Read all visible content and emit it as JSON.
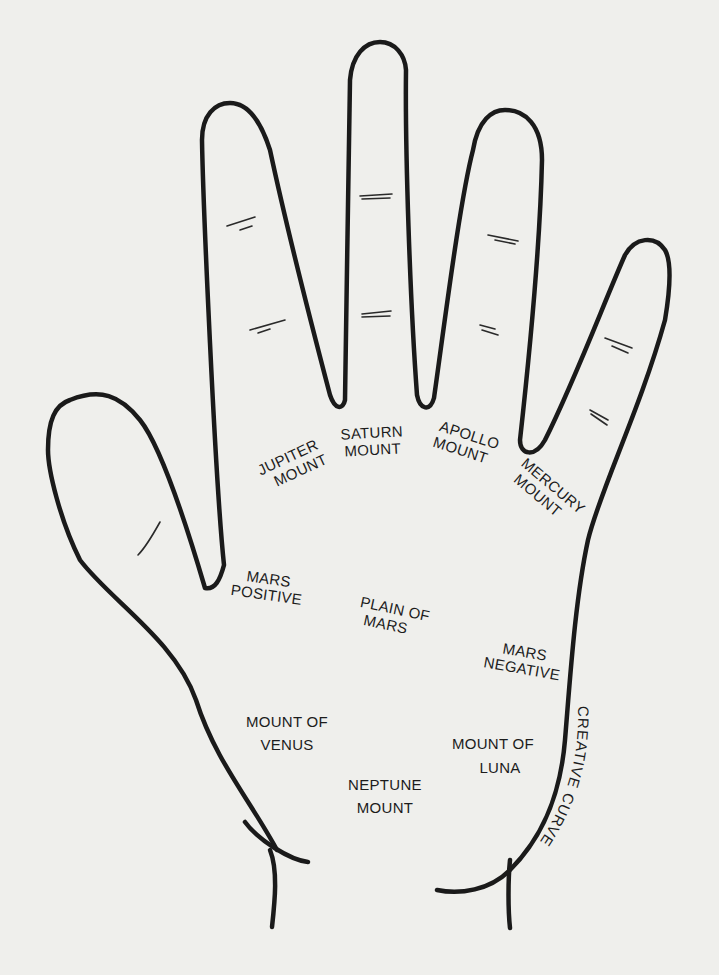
{
  "diagram": {
    "type": "palmistry-hand-map",
    "colors": {
      "background": "#efefec",
      "ink": "#1a1a1a"
    },
    "labels": {
      "jupiter": {
        "line1": "JUPITER",
        "line2": "MOUNT"
      },
      "saturn": {
        "line1": "SATURN",
        "line2": "MOUNT"
      },
      "apollo": {
        "line1": "APOLLO",
        "line2": "MOUNT"
      },
      "mercury": {
        "line1": "MERCURY",
        "line2": "MOUNT"
      },
      "mars_positive": {
        "line1": "MARS",
        "line2": "POSITIVE"
      },
      "plain_of_mars": {
        "line1": "PLAIN OF",
        "line2": "MARS"
      },
      "mars_negative": {
        "line1": "MARS",
        "line2": "NEGATIVE"
      },
      "venus": {
        "line1": "MOUNT OF",
        "line2": "VENUS"
      },
      "luna": {
        "line1": "MOUNT OF",
        "line2": "LUNA"
      },
      "neptune": {
        "line1": "NEPTUNE",
        "line2": "MOUNT"
      },
      "creative_curve": "CREATIVE CURVE"
    }
  }
}
